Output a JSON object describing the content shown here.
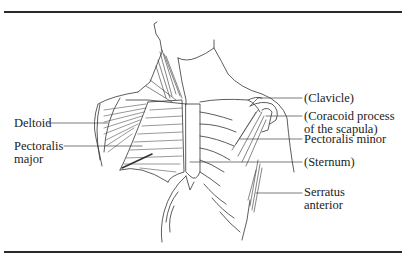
{
  "figure": {
    "labels_left": [
      {
        "id": "deltoid",
        "lines": [
          "Deltoid"
        ]
      },
      {
        "id": "pectoralis-major",
        "lines": [
          "Pectoralis",
          "major"
        ]
      }
    ],
    "labels_right": [
      {
        "id": "clavicle",
        "lines": [
          "(Clavicle)"
        ]
      },
      {
        "id": "coracoid",
        "lines": [
          "(Coracoid process",
          "of the scapula)"
        ]
      },
      {
        "id": "pectoralis-minor",
        "lines": [
          "Pectoralis minor"
        ]
      },
      {
        "id": "sternum",
        "lines": [
          "(Sternum)"
        ]
      },
      {
        "id": "serratus-anterior",
        "lines": [
          "Serratus",
          "anterior"
        ]
      }
    ]
  },
  "colors": {
    "ink": "#222222",
    "rule": "#2a2a2a",
    "background": "#ffffff"
  }
}
